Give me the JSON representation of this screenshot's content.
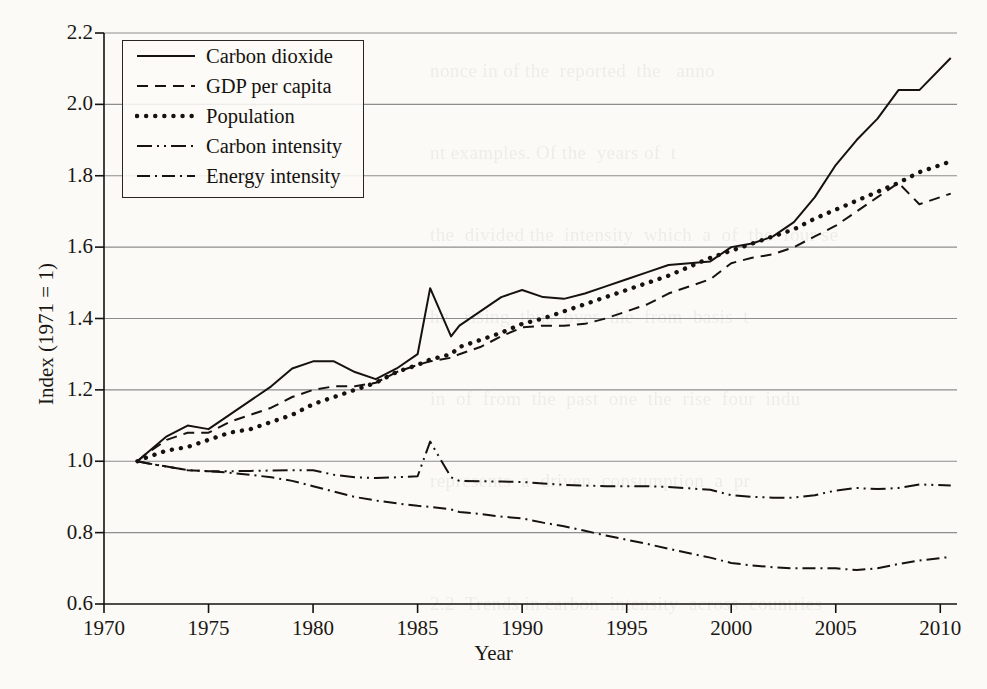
{
  "figure": {
    "background_color": "#fbfaf7",
    "ink_color": "#15120f",
    "gridline_color": "#8d8d8d"
  },
  "axes": {
    "x_title": "Year",
    "y_title": "Index (1971 = 1)",
    "x_ticks": [
      "1970",
      "1975",
      "1980",
      "1985",
      "1990",
      "1995",
      "2000",
      "2005",
      "2010"
    ],
    "y_ticks": [
      "0.6",
      "0.8",
      "1.0",
      "1.2",
      "1.4",
      "1.6",
      "1.8",
      "2.0",
      "2.2"
    ]
  },
  "legend": {
    "items": [
      {
        "label": "Carbon dioxide",
        "style": "solid"
      },
      {
        "label": "GDP per capita",
        "style": "dashed"
      },
      {
        "label": "Population",
        "style": "dotted"
      },
      {
        "label": "Carbon intensity",
        "style": "dashdotdot"
      },
      {
        "label": "Energy intensity",
        "style": "dashdot"
      }
    ]
  },
  "page_bleed_text": "nonce in of the  reported  the   anno\n\nnt examples. Of the  years of  t\n\nthe  divided the  intensity  which  a  of  the  four se\n\nhe   rising  thus  over  the  from  basis  t\n\nin  of  from  the  past  one  the  rise  four  indu\n\nrepresents  a  driven  consumption  a  pr\n\n\n2.2  Trends in carbon  intensity  across  countries\n\n\nthe  region  in  the  world  and  over  the  same\n\n in  the   over  indexed  by  population  and  t",
  "chart_data": {
    "type": "line",
    "title": "",
    "xlabel": "Year",
    "ylabel": "Index (1971 = 1)",
    "xlim": [
      1970,
      2010.8
    ],
    "ylim": [
      0.6,
      2.2
    ],
    "grid": "horizontal",
    "legend_position": "top-left-inside",
    "x": [
      1971.6,
      1972,
      1973,
      1974,
      1975,
      1976,
      1977,
      1978,
      1979,
      1980,
      1981,
      1982,
      1983,
      1984,
      1985,
      1985.6,
      1986.6,
      1987,
      1988,
      1989,
      1990,
      1991,
      1992,
      1993,
      1994,
      1995,
      1996,
      1997,
      1998,
      1999,
      2000,
      2001,
      2002,
      2003,
      2004,
      2005,
      2006,
      2007,
      2008,
      2009,
      2010.5
    ],
    "series": [
      {
        "name": "Carbon dioxide",
        "style": "solid",
        "values": [
          1.0,
          1.02,
          1.07,
          1.1,
          1.09,
          1.13,
          1.17,
          1.21,
          1.26,
          1.28,
          1.28,
          1.25,
          1.23,
          1.26,
          1.3,
          1.485,
          1.35,
          1.38,
          1.42,
          1.46,
          1.48,
          1.46,
          1.455,
          1.47,
          1.49,
          1.51,
          1.53,
          1.55,
          1.555,
          1.56,
          1.6,
          1.61,
          1.63,
          1.67,
          1.74,
          1.83,
          1.9,
          1.96,
          2.04,
          2.04,
          2.13
        ]
      },
      {
        "name": "GDP per capita",
        "style": "dashed",
        "values": [
          1.0,
          1.02,
          1.06,
          1.08,
          1.08,
          1.11,
          1.13,
          1.15,
          1.18,
          1.2,
          1.21,
          1.21,
          1.22,
          1.25,
          1.27,
          1.28,
          1.29,
          1.3,
          1.32,
          1.35,
          1.375,
          1.38,
          1.38,
          1.385,
          1.4,
          1.42,
          1.44,
          1.47,
          1.49,
          1.51,
          1.555,
          1.57,
          1.58,
          1.6,
          1.63,
          1.66,
          1.7,
          1.74,
          1.78,
          1.72,
          1.75
        ]
      },
      {
        "name": "Population",
        "style": "dotted",
        "values": [
          1.0,
          1.01,
          1.03,
          1.04,
          1.06,
          1.08,
          1.09,
          1.11,
          1.13,
          1.16,
          1.18,
          1.2,
          1.22,
          1.25,
          1.27,
          1.285,
          1.3,
          1.32,
          1.34,
          1.36,
          1.385,
          1.4,
          1.42,
          1.44,
          1.46,
          1.48,
          1.5,
          1.52,
          1.545,
          1.57,
          1.59,
          1.61,
          1.63,
          1.65,
          1.68,
          1.705,
          1.73,
          1.755,
          1.78,
          1.81,
          1.84
        ]
      },
      {
        "name": "Carbon intensity",
        "style": "dashdotdot",
        "values": [
          1.0,
          0.995,
          0.985,
          0.975,
          0.972,
          0.972,
          0.973,
          0.974,
          0.975,
          0.975,
          0.962,
          0.955,
          0.953,
          0.955,
          0.958,
          1.055,
          0.955,
          0.945,
          0.944,
          0.943,
          0.942,
          0.938,
          0.934,
          0.932,
          0.93,
          0.93,
          0.93,
          0.928,
          0.924,
          0.92,
          0.905,
          0.9,
          0.898,
          0.898,
          0.905,
          0.918,
          0.925,
          0.922,
          0.925,
          0.935,
          0.932
        ]
      },
      {
        "name": "Energy intensity",
        "style": "dashdot",
        "values": [
          1.0,
          0.995,
          0.985,
          0.975,
          0.972,
          0.968,
          0.962,
          0.955,
          0.945,
          0.93,
          0.915,
          0.9,
          0.89,
          0.882,
          0.875,
          0.872,
          0.865,
          0.858,
          0.852,
          0.845,
          0.84,
          0.828,
          0.818,
          0.805,
          0.792,
          0.78,
          0.768,
          0.755,
          0.742,
          0.73,
          0.715,
          0.708,
          0.703,
          0.7,
          0.7,
          0.7,
          0.695,
          0.7,
          0.712,
          0.722,
          0.732
        ]
      }
    ]
  }
}
